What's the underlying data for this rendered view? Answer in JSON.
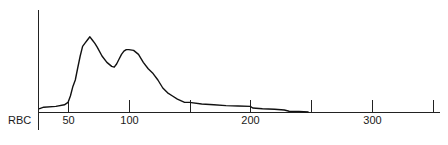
{
  "chart_data": {
    "type": "line",
    "title": "",
    "xlabel": "",
    "ylabel": "RBC",
    "y_axis_label": "RBC",
    "xlim": [
      25,
      355
    ],
    "ylim": [
      0,
      100
    ],
    "x_ticks": [
      50,
      100,
      150,
      200,
      250,
      300,
      350
    ],
    "x_tick_labels": [
      "50",
      "100",
      "",
      "200",
      "",
      "300",
      ""
    ],
    "grid": false,
    "legend": null,
    "series": [
      {
        "name": "RBC histogram",
        "x": [
          25,
          30,
          40,
          47,
          50,
          52,
          54,
          56,
          58,
          60,
          62,
          64,
          66,
          68,
          70,
          72,
          74,
          78,
          82,
          86,
          88,
          90,
          92,
          94,
          96,
          98,
          100,
          104,
          108,
          112,
          116,
          120,
          124,
          128,
          132,
          136,
          140,
          146,
          150,
          160,
          170,
          180,
          190,
          200,
          202,
          210,
          220,
          228,
          232,
          240,
          248
        ],
        "values": [
          4,
          6,
          7,
          9,
          12,
          20,
          32,
          40,
          55,
          70,
          82,
          86,
          90,
          94,
          90,
          86,
          81,
          70,
          62,
          57,
          56,
          60,
          66,
          72,
          76,
          78,
          78,
          77,
          72,
          62,
          54,
          48,
          40,
          30,
          24,
          20,
          16,
          12,
          12,
          10,
          9,
          8,
          7.5,
          7,
          5,
          4,
          3.5,
          2.5,
          1,
          0.8,
          0
        ]
      }
    ],
    "annotations": []
  },
  "axis": {
    "y_label": "RBC",
    "x_tick_labels": [
      "50",
      "100",
      "200",
      "300"
    ]
  }
}
